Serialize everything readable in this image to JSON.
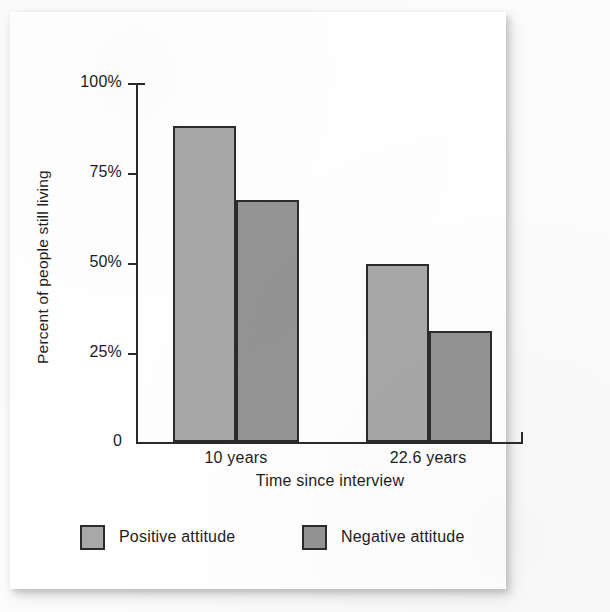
{
  "chart_data": {
    "type": "bar",
    "title": "",
    "xlabel": "Time since interview",
    "ylabel": "Percent of people still living",
    "categories": [
      "10 years",
      "22.6 years"
    ],
    "series": [
      {
        "name": "Positive attitude",
        "color": "#a8a8a8",
        "values": [
          88,
          49.5
        ]
      },
      {
        "name": "Negative attitude",
        "color": "#949494",
        "values": [
          67.5,
          31
        ]
      }
    ],
    "ylim": [
      0,
      100
    ],
    "ytick_labels": [
      "100%",
      "75%",
      "50%",
      "25%",
      "0"
    ],
    "ytick_values": [
      100,
      75,
      50,
      25,
      0
    ],
    "grid": false,
    "legend_position": "bottom",
    "value_unit": "percent"
  },
  "axes": {
    "y_title": "Percent of people still living",
    "x_title": "Time since interview",
    "y_ticks": [
      {
        "label": "100%",
        "value": 100
      },
      {
        "label": "75%",
        "value": 75
      },
      {
        "label": "50%",
        "value": 50
      },
      {
        "label": "25%",
        "value": 25
      },
      {
        "label": "0",
        "value": 0
      }
    ],
    "categories": [
      {
        "label": "10 years"
      },
      {
        "label": "22.6 years"
      }
    ]
  },
  "bars": [
    {
      "name": "positive-10-years",
      "series": "Positive attitude",
      "category": "10 years",
      "value": 88,
      "color": "#a8a8a8"
    },
    {
      "name": "negative-10-years",
      "series": "Negative attitude",
      "category": "10 years",
      "value": 67.5,
      "color": "#949494"
    },
    {
      "name": "positive-22-6-years",
      "series": "Positive attitude",
      "category": "22.6 years",
      "value": 49.5,
      "color": "#a8a8a8"
    },
    {
      "name": "negative-22-6-years",
      "series": "Negative attitude",
      "category": "22.6 years",
      "value": 31,
      "color": "#949494"
    }
  ],
  "legend": {
    "items": [
      {
        "label": "Positive attitude",
        "color": "#a8a8a8"
      },
      {
        "label": "Negative attitude",
        "color": "#949494"
      }
    ]
  },
  "colors": {
    "positive": "#a8a8a8",
    "negative": "#949494",
    "axis": "#2a2a2a",
    "bar_outline": "#2b2b2b",
    "paper": "#ffffff",
    "text": "#1d1d1d"
  }
}
